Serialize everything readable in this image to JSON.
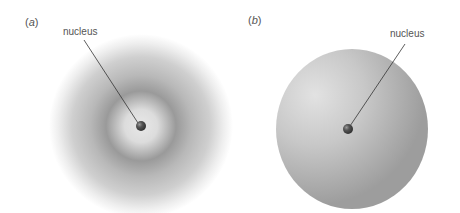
{
  "figure": {
    "panels": [
      {
        "id": "a",
        "label_prefix": "(",
        "label_letter": "a",
        "label_suffix": ")",
        "callout": "nucleus",
        "depiction": "diffuse electron cloud with density shells"
      },
      {
        "id": "b",
        "label_prefix": "(",
        "label_letter": "b",
        "label_suffix": ")",
        "callout": "nucleus",
        "depiction": "solid sphere boundary surface"
      }
    ],
    "colors": {
      "background": "#ffffff",
      "cloud": "#8a8a8a",
      "sphere": "#b5b5b5",
      "nucleus": "#4a4a4a",
      "line": "#333333",
      "text": "#555555"
    }
  }
}
